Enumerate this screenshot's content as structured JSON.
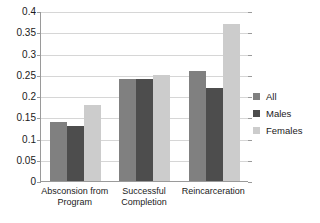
{
  "chart_data": {
    "type": "bar",
    "title": "",
    "subtitle": "",
    "xlabel": "",
    "ylabel": "",
    "categories": [
      "Absconsion from\nProgram",
      "Successful\nCompletion",
      "Reincarceration"
    ],
    "series": [
      {
        "name": "All",
        "color": "#808080",
        "values": [
          0.14,
          0.24,
          0.26
        ]
      },
      {
        "name": "Males",
        "color": "#4d4d4d",
        "values": [
          0.13,
          0.24,
          0.22
        ]
      },
      {
        "name": "Females",
        "color": "#cccccc",
        "values": [
          0.18,
          0.25,
          0.37
        ]
      }
    ],
    "ylim": [
      0,
      0.4
    ],
    "ytick_values": [
      0,
      0.05,
      0.1,
      0.15,
      0.2,
      0.25,
      0.3,
      0.35,
      0.4
    ],
    "ytick_labels": [
      "0",
      "0.05",
      "0.1",
      "0.15",
      "0.2",
      "0.25",
      "0.3",
      "0.35",
      "0.4"
    ],
    "grid": true,
    "legend_position": "right",
    "axis_color": "#9a9a9a",
    "grid_color": "#d6d6d6",
    "background_color": "#ffffff"
  }
}
